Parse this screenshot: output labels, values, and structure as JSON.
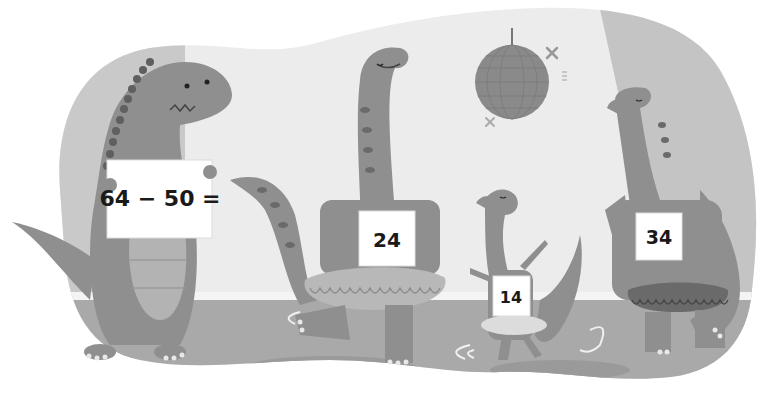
{
  "scene": {
    "description": "Illustration of four dinosaurs at a dance party with a disco ball",
    "colors": {
      "background": "#ffffff",
      "wall": "#ececec",
      "wall_shadow": "#c4c4c4",
      "floor": "#a7a7a7",
      "floor_stripe": "#f2f2f2",
      "dino_body": "#8f8f8f",
      "dino_belly": "#b5b5b5",
      "dino_spots": "#6a6a6a",
      "sign_fill": "#ffffff",
      "text": "#1a1a1a",
      "disco_ball": "#8a8a8a"
    }
  },
  "characters": [
    {
      "id": "dino-sign-holder",
      "role": "holding question sign",
      "sign_text": "64 − 50 ="
    },
    {
      "id": "dino-tall-tutu",
      "role": "dancing in tutu",
      "bib_number": "24"
    },
    {
      "id": "dino-small-tutu",
      "role": "dancing in tutu",
      "bib_number": "14"
    },
    {
      "id": "dino-right-tutu",
      "role": "dancing in tutu",
      "bib_number": "34"
    }
  ],
  "props": {
    "disco_ball": "disco-ball-icon",
    "sparkles": [
      "sparkle-icon",
      "sparkle-icon",
      "sparkle-icon"
    ]
  }
}
